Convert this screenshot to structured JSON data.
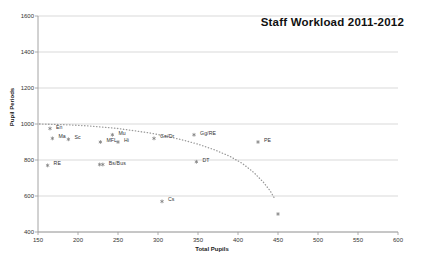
{
  "chart_data": {
    "type": "scatter",
    "title": "Staff Workload 2011-2012",
    "xlabel": "Total Pupils",
    "ylabel": "Pupil Periods",
    "xlim": [
      150,
      600
    ],
    "ylim": [
      400,
      1600
    ],
    "xticks": [
      150,
      200,
      250,
      300,
      350,
      400,
      450,
      500,
      550,
      600
    ],
    "yticks": [
      400,
      600,
      800,
      1000,
      1200,
      1400,
      1600
    ],
    "grid": "horizontal",
    "legend": "none",
    "marker_color": "#808080",
    "trendline": {
      "style": "dotted",
      "color": "#9a9a9a",
      "points": [
        [
          152,
          1000
        ],
        [
          170,
          998
        ],
        [
          190,
          995
        ],
        [
          210,
          990
        ],
        [
          230,
          983
        ],
        [
          250,
          975
        ],
        [
          270,
          963
        ],
        [
          290,
          950
        ],
        [
          310,
          933
        ],
        [
          330,
          912
        ],
        [
          350,
          888
        ],
        [
          370,
          858
        ],
        [
          390,
          820
        ],
        [
          405,
          782
        ],
        [
          420,
          730
        ],
        [
          432,
          675
        ],
        [
          440,
          630
        ],
        [
          445,
          592
        ]
      ]
    },
    "points": [
      {
        "label": "En",
        "x": 165,
        "y": 975,
        "lx": 6,
        "ly": -2
      },
      {
        "label": "Ma",
        "x": 168,
        "y": 920,
        "lx": 6,
        "ly": -2
      },
      {
        "label": "Sc",
        "x": 188,
        "y": 915,
        "lx": 6,
        "ly": -2
      },
      {
        "label": "Mu",
        "x": 243,
        "y": 940,
        "lx": 6,
        "ly": -2
      },
      {
        "label": "MFL",
        "x": 228,
        "y": 900,
        "lx": 6,
        "ly": -2
      },
      {
        "label": "Hi",
        "x": 250,
        "y": 900,
        "lx": 6,
        "ly": -2
      },
      {
        "label": "Ge/Dr",
        "x": 295,
        "y": 920,
        "lx": 6,
        "ly": -2
      },
      {
        "label": "Gg/RE",
        "x": 345,
        "y": 940,
        "lx": 6,
        "ly": -2
      },
      {
        "label": "PE",
        "x": 425,
        "y": 900,
        "lx": 6,
        "ly": -2
      },
      {
        "label": "DT",
        "x": 348,
        "y": 790,
        "lx": 6,
        "ly": -2
      },
      {
        "label": "RE",
        "x": 162,
        "y": 770,
        "lx": 6,
        "ly": -2
      },
      {
        "label": "Bs/Bus",
        "x": 231,
        "y": 775,
        "lx": 6,
        "ly": -2
      },
      {
        "label": "",
        "x": 227,
        "y": 775,
        "lx": 0,
        "ly": 0
      },
      {
        "label": "Cs",
        "x": 305,
        "y": 570,
        "lx": 6,
        "ly": -2
      },
      {
        "label": "",
        "x": 450,
        "y": 500,
        "lx": 0,
        "ly": 0
      }
    ]
  }
}
